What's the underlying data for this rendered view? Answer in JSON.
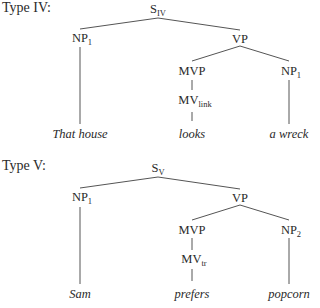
{
  "diagrams": [
    {
      "label": "Type IV:",
      "root": {
        "base": "S",
        "sub": "IV"
      },
      "subject": {
        "base": "NP",
        "sub": "1"
      },
      "vp": {
        "base": "VP"
      },
      "mvp": {
        "base": "MVP"
      },
      "mv": {
        "base": "MV",
        "sub": "link"
      },
      "object": {
        "base": "NP",
        "sub": "1"
      },
      "words": {
        "subject": "That house",
        "verb": "looks",
        "object": "a wreck"
      }
    },
    {
      "label": "Type V:",
      "root": {
        "base": "S",
        "sub": "V"
      },
      "subject": {
        "base": "NP",
        "sub": "1"
      },
      "vp": {
        "base": "VP"
      },
      "mvp": {
        "base": "MVP"
      },
      "mv": {
        "base": "MV",
        "sub": "tr"
      },
      "object": {
        "base": "NP",
        "sub": "2"
      },
      "words": {
        "subject": "Sam",
        "verb": "prefers",
        "object": "popcorn"
      }
    }
  ]
}
